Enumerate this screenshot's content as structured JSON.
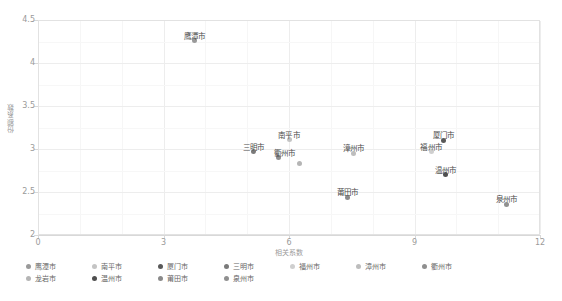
{
  "chart_data": {
    "type": "scatter",
    "title": "",
    "xlabel": "相关系数",
    "ylabel": "份额系数",
    "xlim": [
      0,
      12
    ],
    "ylim": [
      2,
      4.5
    ],
    "xticks": [
      "0",
      "3",
      "6",
      "9",
      "12"
    ],
    "yticks": [
      "2",
      "2.5",
      "3",
      "3.5",
      "4",
      "4.5"
    ],
    "grid": true,
    "legend_position": "bottom",
    "points": [
      {
        "name": "鹰潭市",
        "x": 3.75,
        "y": 4.26,
        "color": "#9a9a9a",
        "label_dx": 0,
        "label_dy": -11,
        "labeled": true
      },
      {
        "name": "南平市",
        "x": 6.0,
        "y": 3.11,
        "color": "#c4c4c4",
        "label_dx": 0,
        "label_dy": -11,
        "labeled": true
      },
      {
        "name": "厦门市",
        "x": 9.7,
        "y": 3.1,
        "color": "#595959",
        "label_dx": 0,
        "label_dy": -11,
        "labeled": true
      },
      {
        "name": "三明市",
        "x": 5.15,
        "y": 2.97,
        "color": "#7a7a7a",
        "label_dx": 0,
        "label_dy": -11,
        "labeled": true
      },
      {
        "name": "福州市",
        "x": 9.4,
        "y": 2.97,
        "color": "#cfcfcf",
        "label_dx": 0,
        "label_dy": -11,
        "labeled": true
      },
      {
        "name": "漳州市",
        "x": 7.55,
        "y": 2.95,
        "color": "#bdbdbd",
        "label_dx": 0,
        "label_dy": -11,
        "labeled": true
      },
      {
        "name": "衢州市",
        "x": 5.75,
        "y": 2.9,
        "color": "#8f8f8f",
        "label_dx": 6,
        "label_dy": -11,
        "labeled": true
      },
      {
        "name": "龙岩市",
        "x": 6.25,
        "y": 2.83,
        "color": "#b5b5b5",
        "label_dx": 0,
        "label_dy": -11,
        "labeled": false
      },
      {
        "name": "温州市",
        "x": 9.75,
        "y": 2.7,
        "color": "#4f4f4f",
        "label_dx": 0,
        "label_dy": -11,
        "labeled": true
      },
      {
        "name": "莆田市",
        "x": 7.4,
        "y": 2.44,
        "color": "#8a8a8a",
        "label_dx": 0,
        "label_dy": -11,
        "labeled": true
      },
      {
        "name": "泉州市",
        "x": 11.2,
        "y": 2.36,
        "color": "#909090",
        "label_dx": 0,
        "label_dy": -11,
        "labeled": true
      }
    ]
  },
  "legend": {
    "items": [
      {
        "label": "鹰潭市",
        "color": "#9a9a9a"
      },
      {
        "label": "南平市",
        "color": "#c4c4c4"
      },
      {
        "label": "厦门市",
        "color": "#595959"
      },
      {
        "label": "三明市",
        "color": "#7a7a7a"
      },
      {
        "label": "福州市",
        "color": "#cfcfcf"
      },
      {
        "label": "漳州市",
        "color": "#bdbdbd"
      },
      {
        "label": "衢州市",
        "color": "#8f8f8f"
      },
      {
        "label": "龙岩市",
        "color": "#b5b5b5"
      },
      {
        "label": "温州市",
        "color": "#4f4f4f"
      },
      {
        "label": "莆田市",
        "color": "#8a8a8a"
      },
      {
        "label": "泉州市",
        "color": "#909090"
      }
    ]
  }
}
